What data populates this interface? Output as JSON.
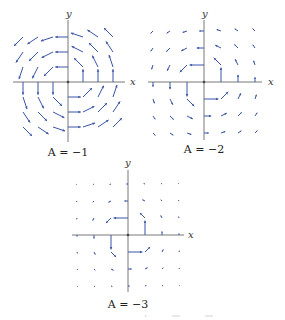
{
  "figure": {
    "arrow_color": "#3b55a6",
    "axis_color": "#555555",
    "panels": [
      {
        "id": "panel-a-neg1",
        "A": -1,
        "caption": "A = −1",
        "x_label": "x",
        "y_label": "y",
        "grid": [
          -3,
          -2,
          -1,
          1,
          2,
          3
        ]
      },
      {
        "id": "panel-a-neg2",
        "A": -2,
        "caption": "A = −2",
        "x_label": "x",
        "y_label": "y",
        "grid": [
          -3,
          -2,
          -1,
          1,
          2,
          3
        ]
      },
      {
        "id": "panel-a-neg3",
        "A": -3,
        "caption": "A = −3",
        "x_label": "x",
        "y_label": "y",
        "grid": [
          -3,
          -2,
          -1,
          1,
          2,
          3
        ]
      }
    ]
  }
}
